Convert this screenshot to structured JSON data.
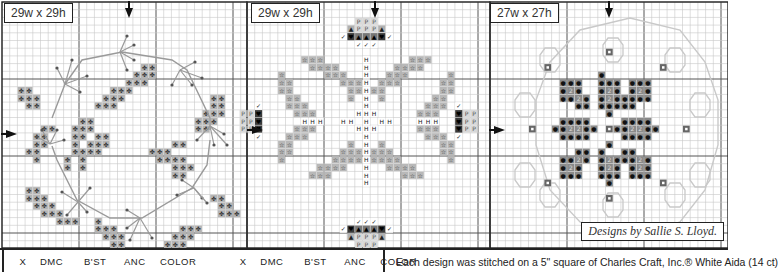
{
  "panels": [
    {
      "label": "29w x 29h",
      "x": 2,
      "cols": 31,
      "label_x": 4
    },
    {
      "label": "29w x 29h",
      "x": 247,
      "cols": 31,
      "label_x": 252
    },
    {
      "label": "27w x 27h",
      "x": 490,
      "cols": 31,
      "label_x": 488
    }
  ],
  "grid": {
    "top": 2,
    "cell": 7.7,
    "rows": 31,
    "line_color": "#c8c8c8",
    "major_color": "#555"
  },
  "colors": {
    "floss_gray": "#b4b4b4",
    "floss_mid": "#8c8c8c",
    "floss_dark": "#3a3a3a",
    "backstitch": "#9a9a9a",
    "outline_light": "#c9c9c9"
  },
  "credit": "Designs by Sallie S. Lloyd.",
  "legend": {
    "headers_left": [
      "X",
      "DMC",
      "B'ST",
      "ANC",
      "COLOR"
    ],
    "headers_right": [
      "X",
      "DMC",
      "B'ST",
      "ANC",
      "COLOR"
    ]
  },
  "note": "Each design was stitched on a 5\" square of Charles Craft, Inc.® White Aida (14 ct)"
}
